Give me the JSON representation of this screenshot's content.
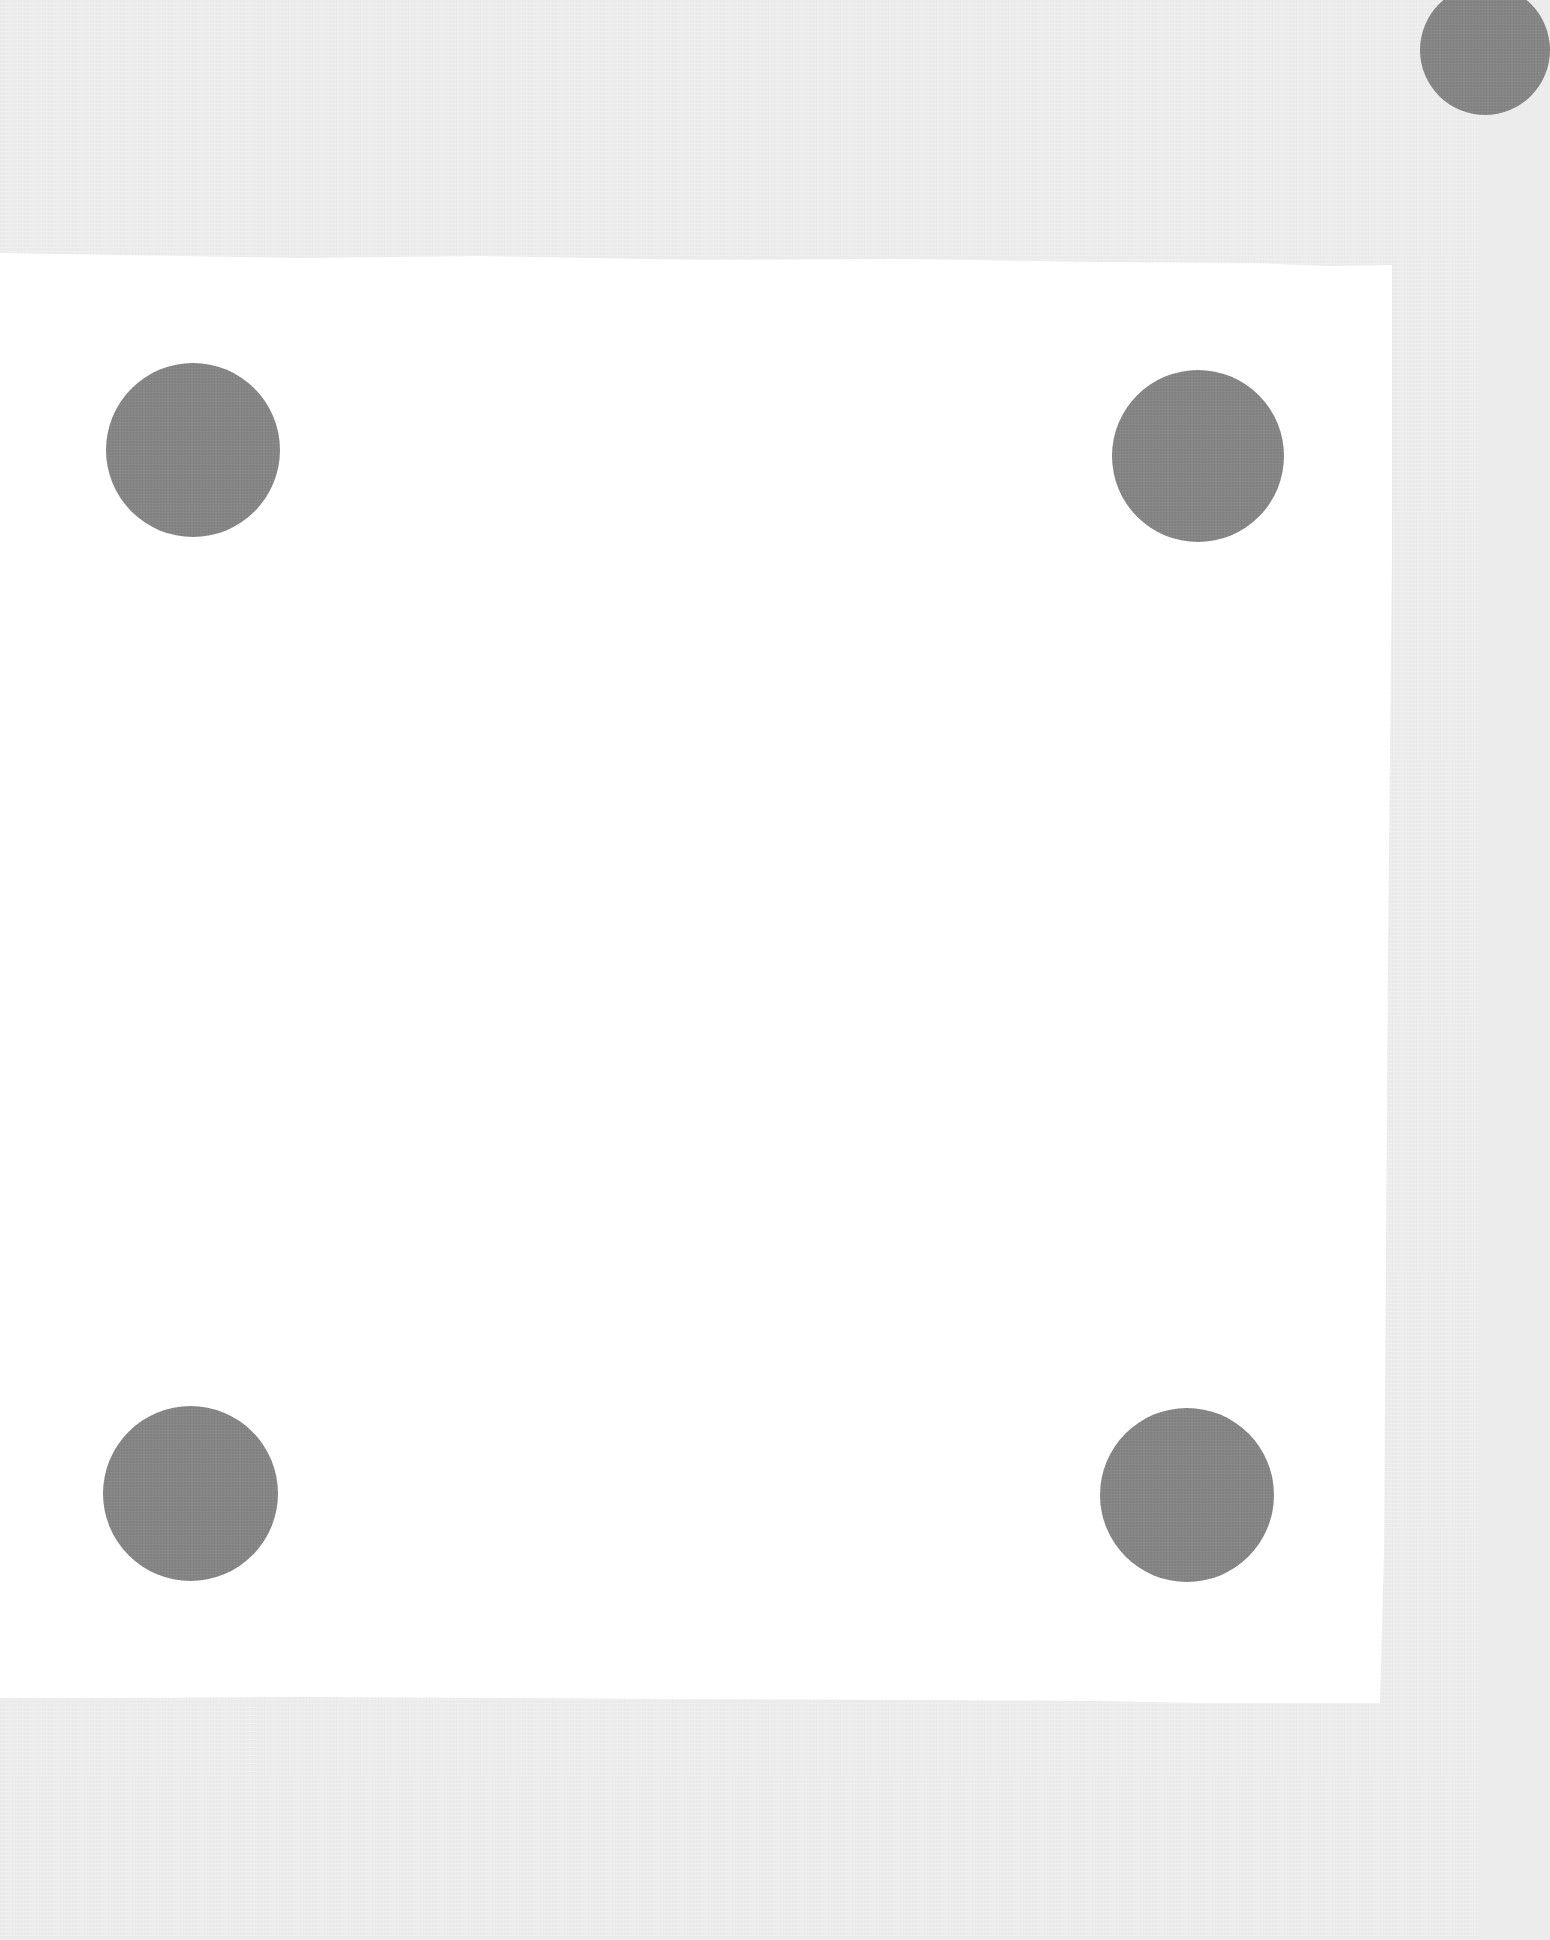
{
  "canvas": {
    "width": 1478,
    "height": 1940,
    "background_color": "#ececec"
  },
  "panel": {
    "color": "#ffffff",
    "left": 0,
    "top": 253,
    "width": 1392,
    "height": 1450
  },
  "dots": {
    "color": "#858585",
    "items": [
      {
        "name": "dot-top-left",
        "cx": 193,
        "cy": 450,
        "d": 174
      },
      {
        "name": "dot-top-right",
        "cx": 1198,
        "cy": 456,
        "d": 172
      },
      {
        "name": "dot-bottom-left",
        "cx": 190,
        "cy": 1493,
        "d": 175
      },
      {
        "name": "dot-bottom-right",
        "cx": 1187,
        "cy": 1495,
        "d": 174
      }
    ]
  },
  "corner_dot": {
    "name": "partial-dot-top-right-corner",
    "cx": 1485,
    "cy": 50,
    "d": 130,
    "color": "#858585"
  }
}
